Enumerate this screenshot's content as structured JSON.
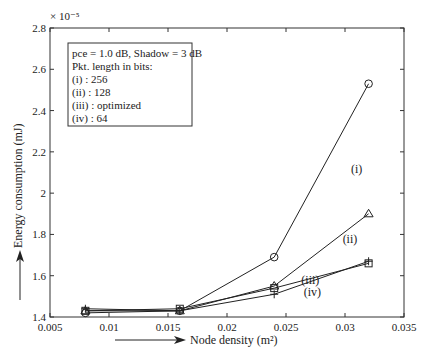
{
  "chart_data": {
    "type": "line",
    "title": "",
    "xlabel": "Node density (m²)",
    "ylabel": "Energy consumption (mJ)",
    "y_multiplier": "× 10⁻⁵",
    "xlim": [
      0.005,
      0.035
    ],
    "ylim": [
      1.4,
      2.8
    ],
    "xticks": [
      0.005,
      0.01,
      0.015,
      0.02,
      0.025,
      0.03,
      0.035
    ],
    "xtick_labels": [
      "0.005",
      "0.01",
      "0.015",
      "0.02",
      "0.025",
      "0.03",
      "0.035"
    ],
    "yticks": [
      1.4,
      1.6,
      1.8,
      2.0,
      2.2,
      2.4,
      2.6,
      2.8
    ],
    "ytick_labels": [
      "1.4",
      "1.6",
      "1.8",
      "2",
      "2.2",
      "2.4",
      "2.6",
      "2.8"
    ],
    "grid": false,
    "x": [
      0.008,
      0.016,
      0.024,
      0.032
    ],
    "series": [
      {
        "name": "(i)",
        "marker": "circle",
        "values": [
          1.42,
          1.43,
          1.69,
          2.53
        ],
        "label_pos": [
          0.0305,
          2.1
        ]
      },
      {
        "name": "(ii)",
        "marker": "triangle",
        "values": [
          1.43,
          1.43,
          1.55,
          1.9
        ],
        "label_pos": [
          0.0298,
          1.76
        ]
      },
      {
        "name": "(iii)",
        "marker": "square",
        "values": [
          1.43,
          1.44,
          1.54,
          1.66
        ],
        "label_pos": [
          0.0263,
          1.56
        ]
      },
      {
        "name": "(iv)",
        "marker": "plus",
        "values": [
          1.44,
          1.43,
          1.51,
          1.67
        ],
        "label_pos": [
          0.0265,
          1.5
        ]
      }
    ],
    "legend": {
      "position": "upper-left",
      "lines": [
        "pce = 1.0 dB, Shadow = 3 dB",
        "Pkt. length in bits:",
        "(i)   : 256",
        "(ii)  : 128",
        "(iii) : optimized",
        "(iv) : 64"
      ]
    }
  }
}
